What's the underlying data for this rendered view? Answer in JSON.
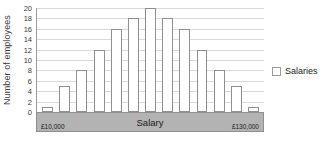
{
  "chart_data": {
    "type": "bar",
    "title": "",
    "xlabel": "Salary",
    "ylabel": "Number of employees",
    "categories": [
      "1",
      "2",
      "3",
      "4",
      "5",
      "6",
      "7",
      "8",
      "9",
      "10",
      "11",
      "12",
      "13"
    ],
    "values": [
      1,
      5,
      8,
      12,
      16,
      18,
      20,
      18,
      16,
      12,
      8,
      5,
      1
    ],
    "series": [
      {
        "name": "Salaries",
        "values": [
          1,
          5,
          8,
          12,
          16,
          18,
          20,
          18,
          16,
          12,
          8,
          5,
          1
        ]
      }
    ],
    "ylim": [
      0,
      20
    ],
    "ytick_labels": [
      "0",
      "2",
      "4",
      "6",
      "8",
      "10",
      "12",
      "14",
      "16",
      "18",
      "20"
    ],
    "ytick_values": [
      0,
      2,
      4,
      6,
      8,
      10,
      12,
      14,
      16,
      18,
      20
    ],
    "x_axis_min_label": "£10,000",
    "x_axis_max_label": "£130,000",
    "grid": true,
    "legend_position": "right",
    "legend": [
      {
        "label": "Salaries",
        "swatch_color": "#ffffff",
        "swatch_border": "#9a9a9a"
      }
    ],
    "colors": {
      "bar_fill": "#ffffff",
      "bar_border": "#8f8f8f",
      "gridline": "#d9d9d9",
      "axis_line": "#9a9a9a",
      "axis_band": "#b3b3b3",
      "text": "#1a1a1a"
    }
  }
}
